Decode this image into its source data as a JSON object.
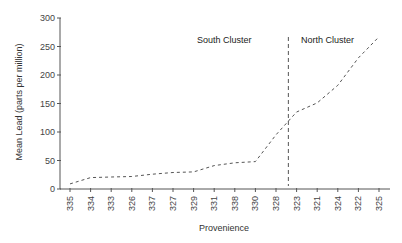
{
  "chart_data": {
    "type": "line",
    "title": "",
    "xlabel": "Provenience",
    "ylabel": "Mean Lead (parts per million)",
    "ylim": [
      0,
      300
    ],
    "yticks": [
      0,
      50,
      100,
      150,
      200,
      250,
      300
    ],
    "grid": false,
    "legend": null,
    "categories": [
      "335",
      "334",
      "333",
      "326",
      "337",
      "327",
      "329",
      "331",
      "338",
      "330",
      "328",
      "323",
      "321",
      "324",
      "322",
      "325"
    ],
    "series": [
      {
        "name": "Mean Lead",
        "line_style": "dashed",
        "values": [
          9,
          20,
          21,
          22,
          26,
          29,
          30,
          41,
          46,
          48,
          95,
          135,
          151,
          182,
          230,
          267
        ]
      }
    ],
    "annotations": [
      {
        "text": "South Cluster",
        "x_category_index": 6.3,
        "y": 260
      },
      {
        "text": "North Cluster",
        "x_category_index": 11.3,
        "y": 260
      }
    ],
    "divider": {
      "style": "dashed-vertical",
      "between": [
        "328",
        "323"
      ],
      "x_category_index": 10.6
    }
  }
}
